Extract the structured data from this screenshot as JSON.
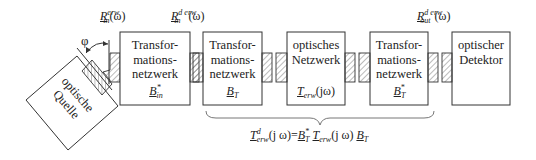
{
  "diagram": {
    "type": "optical-network-block-diagram",
    "labels": {
      "input_port": {
        "base": "R",
        "sub": "in",
        "sup": "erw",
        "arg": "(ω)"
      },
      "input_port_d": {
        "base": "R",
        "sub": "in",
        "sup": "d erw",
        "arg": "(ω)"
      },
      "output_port_d": {
        "base": "R",
        "sub": "out",
        "sup": "d erw",
        "arg": "(ω)"
      },
      "angle": "φ"
    },
    "source": {
      "line1": "optische",
      "line2": "Quelle"
    },
    "blocks": [
      {
        "id": "transform-in",
        "line1": "Transfor-",
        "line2": "mations-",
        "line3": "netzwerk",
        "sym_base": "B",
        "sym_sub": "in",
        "sym_sup": "*"
      },
      {
        "id": "transform-t",
        "line1": "Transfor-",
        "line2": "mations-",
        "line3": "netzwerk",
        "sym_base": "B",
        "sym_sub": "T",
        "sym_sup": ""
      },
      {
        "id": "optical-network",
        "line1": "optisches",
        "line2": "Netzwerk",
        "sym_base": "T",
        "sym_sub": "erw",
        "sym_arg": "(jω)"
      },
      {
        "id": "transform-t-star",
        "line1": "Transfor-",
        "line2": "mations-",
        "line3": "netzwerk",
        "sym_base": "B",
        "sym_sub": "T",
        "sym_sup": "*"
      },
      {
        "id": "detector",
        "line1": "optischer",
        "line2": "Detektor"
      }
    ],
    "formula": {
      "lhs_base": "T",
      "lhs_sup": "d",
      "lhs_sub": "erw",
      "lhs_arg": "(j ω)",
      "eq": "=",
      "t1_base": "B",
      "t1_sub": "T",
      "t1_sup": "*",
      "t2_base": "T",
      "t2_sub": "erw",
      "t2_arg": "(j ω)",
      "t3_base": "B",
      "t3_sub": "T"
    }
  }
}
